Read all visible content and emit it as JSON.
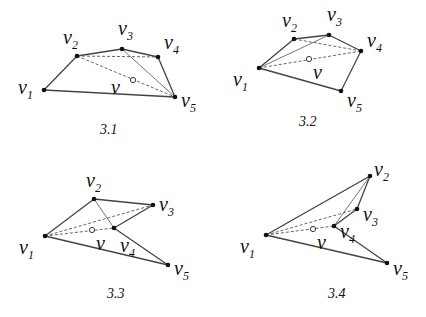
{
  "figures": [
    {
      "caption": "3.1",
      "center_label": "v",
      "vertices": [
        {
          "name": "v",
          "sub": "1"
        },
        {
          "name": "v",
          "sub": "2"
        },
        {
          "name": "v",
          "sub": "3"
        },
        {
          "name": "v",
          "sub": "4"
        },
        {
          "name": "v",
          "sub": "5"
        }
      ],
      "solid_edges": [
        [
          1,
          2
        ],
        [
          2,
          3
        ],
        [
          3,
          4
        ],
        [
          4,
          5
        ],
        [
          5,
          1
        ]
      ],
      "thin_edges": [
        [
          3,
          5
        ]
      ],
      "dashed_edges": [
        [
          2,
          4
        ],
        [
          2,
          5
        ]
      ]
    },
    {
      "caption": "3.2",
      "center_label": "v",
      "vertices": [
        {
          "name": "v",
          "sub": "1"
        },
        {
          "name": "v",
          "sub": "2"
        },
        {
          "name": "v",
          "sub": "3"
        },
        {
          "name": "v",
          "sub": "4"
        },
        {
          "name": "v",
          "sub": "5"
        }
      ],
      "solid_edges": [
        [
          1,
          2
        ],
        [
          2,
          3
        ],
        [
          3,
          4
        ],
        [
          4,
          5
        ],
        [
          5,
          1
        ]
      ],
      "thin_edges": [
        [
          1,
          3
        ]
      ],
      "dashed_edges": [
        [
          1,
          4
        ],
        [
          2,
          4
        ]
      ]
    },
    {
      "caption": "3.3",
      "center_label": "v",
      "vertices": [
        {
          "name": "v",
          "sub": "1"
        },
        {
          "name": "v",
          "sub": "2"
        },
        {
          "name": "v",
          "sub": "3"
        },
        {
          "name": "v",
          "sub": "4"
        },
        {
          "name": "v",
          "sub": "5"
        }
      ],
      "solid_edges": [
        [
          1,
          2
        ],
        [
          2,
          3
        ],
        [
          3,
          4
        ],
        [
          4,
          5
        ],
        [
          5,
          1
        ]
      ],
      "thin_edges": [
        [
          2,
          4
        ]
      ],
      "dashed_edges": [
        [
          1,
          3
        ],
        [
          1,
          4
        ]
      ]
    },
    {
      "caption": "3.4",
      "center_label": "v",
      "vertices": [
        {
          "name": "v",
          "sub": "1"
        },
        {
          "name": "v",
          "sub": "2"
        },
        {
          "name": "v",
          "sub": "3"
        },
        {
          "name": "v",
          "sub": "4"
        },
        {
          "name": "v",
          "sub": "5"
        }
      ],
      "solid_edges": [
        [
          1,
          2
        ],
        [
          2,
          3
        ],
        [
          3,
          4
        ],
        [
          4,
          5
        ],
        [
          5,
          1
        ]
      ],
      "thin_edges": [
        [
          2,
          4
        ]
      ],
      "dashed_edges": [
        [
          1,
          3
        ],
        [
          1,
          4
        ]
      ]
    }
  ]
}
